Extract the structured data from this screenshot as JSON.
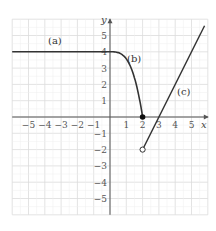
{
  "chart_data": {
    "type": "line",
    "title": "",
    "xlabel": "x",
    "ylabel": "y",
    "xlim": [
      -6,
      6
    ],
    "ylim": [
      -6,
      6
    ],
    "grid": true,
    "x_ticks": [
      -5,
      -4,
      -3,
      -2,
      -1,
      1,
      2,
      3,
      4,
      5
    ],
    "y_ticks": [
      5,
      4,
      3,
      2,
      1,
      -1,
      -2,
      -3,
      -4,
      -5
    ],
    "x_tick_labels": [
      "−5",
      "−4",
      "−3",
      "−2",
      "−1",
      "1",
      "2",
      "3",
      "4",
      "5"
    ],
    "y_tick_labels": [
      "5",
      "4",
      "3",
      "2",
      "1",
      "−1",
      "−2",
      "−3",
      "−4",
      "−5"
    ],
    "series": [
      {
        "name": "(a)",
        "description": "horizontal line y = 4 for x ≤ 0",
        "points": [
          [
            -6,
            4
          ],
          [
            0,
            4
          ]
        ]
      },
      {
        "name": "(b)",
        "description": "curve decreasing from (0,4) to (2,0), filled endpoint at (2,0)",
        "points": [
          [
            0,
            4
          ],
          [
            0.5,
            3.9
          ],
          [
            1,
            3.5
          ],
          [
            1.5,
            2.4
          ],
          [
            2,
            0
          ]
        ],
        "endpoint": {
          "x": 2,
          "y": 0,
          "style": "closed"
        }
      },
      {
        "name": "(c)",
        "description": "line y = 2x − 6 for x > 2, open endpoint at (2,−2)",
        "points": [
          [
            2,
            -2
          ],
          [
            3,
            0
          ],
          [
            5.8,
            5.6
          ]
        ],
        "endpoint": {
          "x": 2,
          "y": -2,
          "style": "open"
        }
      }
    ],
    "annotations": [
      {
        "text": "(a)",
        "x": -3,
        "y": 4.5
      },
      {
        "text": "(b)",
        "x": 1.3,
        "y": 3.5
      },
      {
        "text": "(c)",
        "x": 4.1,
        "y": 1.5
      }
    ]
  },
  "labels": {
    "x_axis": "x",
    "y_axis": "y",
    "a": "(a)",
    "b": "(b)",
    "c": "(c)"
  },
  "colors": {
    "grid": "#dcdcdc",
    "axis": "#555555",
    "curve": "#333333"
  }
}
